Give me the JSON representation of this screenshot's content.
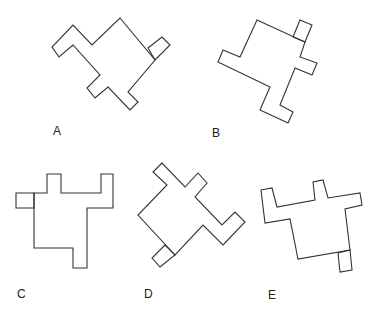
{
  "figure": {
    "type": "spatial-reasoning rotated polyomino shapes",
    "options": [
      {
        "id": "A",
        "label": "A"
      },
      {
        "id": "B",
        "label": "B"
      },
      {
        "id": "C",
        "label": "C"
      },
      {
        "id": "D",
        "label": "D"
      },
      {
        "id": "E",
        "label": "E"
      }
    ]
  },
  "colors": {
    "stroke": "#333333",
    "background": "#ffffff",
    "label": "#222222"
  }
}
